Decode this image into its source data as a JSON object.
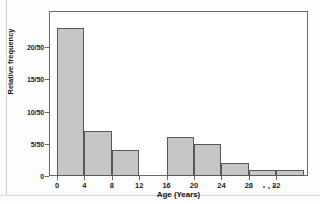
{
  "chart_data": {
    "type": "bar",
    "title": "",
    "xlabel": "Age (Years)",
    "ylabel": "Relative frequency",
    "grid": false,
    "legend": false,
    "bin_width": 4,
    "xlim": [
      -2,
      36
    ],
    "ylim": [
      0,
      25
    ],
    "ytick_labels": [
      "0",
      "5/50",
      "10/50",
      "15/50",
      "20/50"
    ],
    "ytick_values": [
      0,
      5,
      10,
      15,
      20
    ],
    "xtick_labels": [
      "0",
      "4",
      "8",
      "12",
      "16",
      "20",
      "24",
      "28",
      "32"
    ],
    "xtick_values": [
      0,
      4,
      8,
      12,
      16,
      20,
      24,
      28,
      32
    ],
    "bars": [
      {
        "label": "0-4",
        "x0": 0,
        "x1": 4,
        "value": 23,
        "display": "23/50"
      },
      {
        "label": "4-8",
        "x0": 4,
        "x1": 8,
        "value": 7,
        "display": "7/50"
      },
      {
        "label": "8-12",
        "x0": 8,
        "x1": 12,
        "value": 4,
        "display": "4/50"
      },
      {
        "label": "16-20",
        "x0": 16,
        "x1": 20,
        "value": 6,
        "display": "6/50"
      },
      {
        "label": "20-24",
        "x0": 20,
        "x1": 24,
        "value": 5,
        "display": "5/50"
      },
      {
        "label": "24-28",
        "x0": 24,
        "x1": 28,
        "value": 2,
        "display": "2/50"
      },
      {
        "label": "28-32",
        "x0": 28,
        "x1": 32,
        "value": 1,
        "display": "1/50"
      },
      {
        "label": "32-36",
        "x0": 32,
        "x1": 36,
        "value": 1,
        "display": "1/50"
      }
    ],
    "colors": {
      "bar_fill": "#c6c6c6",
      "bar_edge": "#585858",
      "axis": "#6a6a6a",
      "text": "#1b1b1b",
      "background": "#ffffff"
    }
  }
}
